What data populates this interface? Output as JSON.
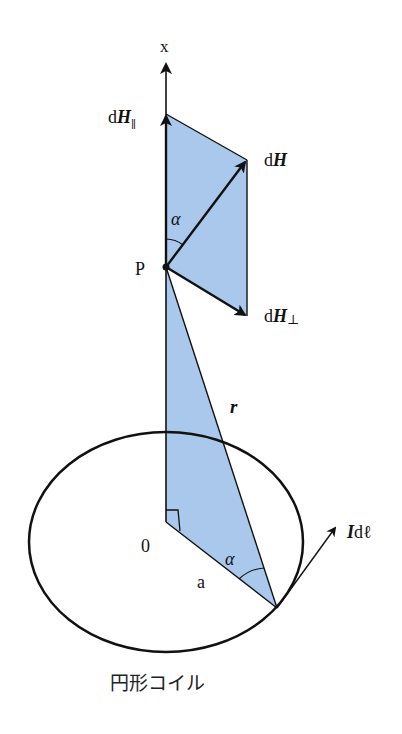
{
  "diagram": {
    "title": "円形コイル",
    "colors": {
      "shade": "#a9c8ec",
      "line": "#111111",
      "background": "#ffffff"
    },
    "axis": {
      "label": "x"
    },
    "labels": {
      "dH_parallel": {
        "prefix": "d",
        "vec": "H",
        "sub": "∥"
      },
      "dH": {
        "prefix": "d",
        "vec": "H"
      },
      "dH_perp": {
        "prefix": "d",
        "vec": "H",
        "sub": "⊥"
      },
      "point_P": "P",
      "alpha_top": "α",
      "alpha_bottom": "α",
      "r": "r",
      "origin": "0",
      "radius": "a",
      "current_element": {
        "vec": "I",
        "suffix": "dℓ"
      }
    },
    "caption": "円形コイル"
  }
}
